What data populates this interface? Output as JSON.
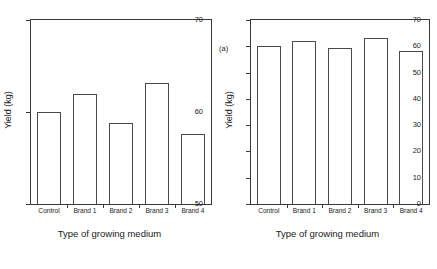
{
  "figure": {
    "caption": ""
  },
  "chart_data": [
    {
      "type": "bar",
      "panel": "(a)",
      "title": "",
      "xlabel": "Type of growing medium",
      "ylabel": "Yield (kg)",
      "categories": [
        "Control",
        "Brand 1",
        "Brand 2",
        "Brand 3",
        "Brand 4"
      ],
      "values": [
        60.0,
        62.0,
        58.8,
        63.2,
        57.6
      ],
      "ylim": [
        50,
        70
      ],
      "yticks": [
        50,
        60,
        70
      ],
      "ytick_labels": [
        "50",
        "60",
        "70"
      ],
      "grid": false,
      "legend": "none",
      "bar_fill": "#ffffff",
      "bar_edge": "#4a4a4a"
    },
    {
      "type": "bar",
      "panel": "(b)",
      "title": "",
      "xlabel": "Type of growing medium",
      "ylabel": "Yield (kg)",
      "categories": [
        "Control",
        "Brand 1",
        "Brand 2",
        "Brand 3",
        "Brand 4"
      ],
      "values": [
        60.0,
        62.0,
        59.5,
        63.2,
        58.1
      ],
      "ylim": [
        0,
        70
      ],
      "yticks": [
        0,
        10,
        20,
        30,
        40,
        50,
        60,
        70
      ],
      "ytick_labels": [
        "0",
        "10",
        "20",
        "30",
        "40",
        "50",
        "60",
        "70"
      ],
      "grid": false,
      "legend": "none",
      "bar_fill": "#ffffff",
      "bar_edge": "#4a4a4a"
    }
  ]
}
